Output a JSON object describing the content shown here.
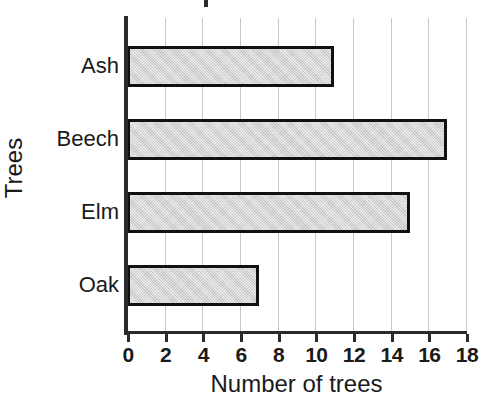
{
  "chart_data": {
    "type": "bar",
    "orientation": "horizontal",
    "title": "",
    "xlabel": "Number of trees",
    "ylabel": "Trees",
    "categories": [
      "Ash",
      "Beech",
      "Elm",
      "Oak"
    ],
    "values": [
      11,
      17,
      15,
      7
    ],
    "xlim": [
      0,
      18
    ],
    "xticks": [
      0,
      2,
      4,
      6,
      8,
      10,
      12,
      14,
      16,
      18
    ],
    "xtick_labels": [
      "0",
      "2",
      "4",
      "6",
      "8",
      "10",
      "12",
      "14",
      "16",
      "18"
    ],
    "grid": true,
    "grid_axis": "x",
    "legend": null,
    "bar_fill_color": "#d2d2d2",
    "bar_edge_color": "#111111",
    "gridline_color": "#c9c9c9",
    "axis_color": "#2a2a2a",
    "background_color": "#ffffff"
  },
  "figure": {
    "title_remnant": "",
    "xlabel": "Number of trees",
    "ylabel": "Trees",
    "xtick_labels": [
      "0",
      "2",
      "4",
      "6",
      "8",
      "10",
      "12",
      "14",
      "16",
      "18"
    ],
    "categories": [
      {
        "label": "Ash",
        "value": 11
      },
      {
        "label": "Beech",
        "value": 17
      },
      {
        "label": "Elm",
        "value": 15
      },
      {
        "label": "Oak",
        "value": 7
      }
    ]
  }
}
